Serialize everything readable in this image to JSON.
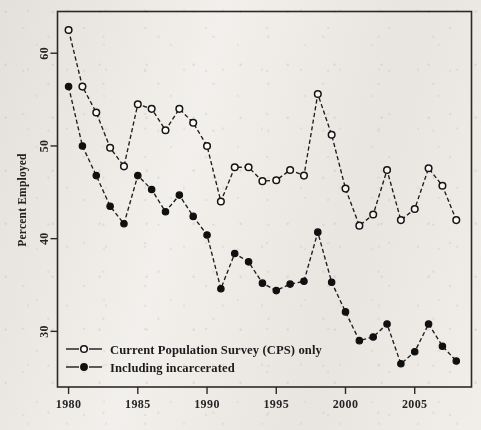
{
  "chart_data": {
    "type": "line",
    "title": "",
    "xlabel": "",
    "ylabel": "Percent Employed",
    "xlim": [
      1979.2,
      2009.1
    ],
    "ylim": [
      24.0,
      64.5
    ],
    "xticks": [
      1980,
      1985,
      1990,
      1995,
      2000,
      2005
    ],
    "yticks": [
      30,
      40,
      50,
      60
    ],
    "grid": false,
    "legend_position": "bottom-left",
    "x": [
      1980,
      1981,
      1982,
      1983,
      1984,
      1985,
      1986,
      1987,
      1988,
      1989,
      1990,
      1991,
      1992,
      1993,
      1994,
      1995,
      1996,
      1997,
      1998,
      1999,
      2000,
      2001,
      2002,
      2003,
      2004,
      2005,
      2006,
      2007,
      2008
    ],
    "series": [
      {
        "name": "Current Population Survey (CPS) only",
        "marker": "open-circle",
        "linestyle": "dashed",
        "values": [
          62.5,
          56.4,
          53.6,
          49.8,
          47.8,
          54.5,
          54.0,
          51.7,
          54.0,
          52.5,
          50.0,
          44.0,
          47.7,
          47.7,
          46.2,
          46.3,
          47.4,
          46.8,
          55.6,
          51.2,
          45.4,
          41.4,
          42.6,
          47.4,
          42.0,
          43.2,
          47.6,
          45.7,
          42.0
        ]
      },
      {
        "name": "Including incarcerated",
        "marker": "filled-circle",
        "linestyle": "dashed",
        "values": [
          56.4,
          50.0,
          46.8,
          43.5,
          41.6,
          46.8,
          45.3,
          42.9,
          44.7,
          42.4,
          40.4,
          34.6,
          38.4,
          37.5,
          35.2,
          34.4,
          35.1,
          35.4,
          40.7,
          35.3,
          32.1,
          29.0,
          29.4,
          30.8,
          26.5,
          27.8,
          30.8,
          28.4,
          26.8
        ]
      }
    ]
  },
  "legend": {
    "items": [
      {
        "label": "Current Population Survey (CPS) only",
        "marker": "open-circle"
      },
      {
        "label": "Including incarcerated",
        "marker": "filled-circle"
      }
    ]
  },
  "axis": {
    "y_title": "Percent Employed",
    "x_tick_labels": [
      "1980",
      "1985",
      "1990",
      "1995",
      "2000",
      "2005"
    ],
    "y_tick_labels": [
      "30",
      "40",
      "50",
      "60"
    ]
  },
  "colors": {
    "ink": "#151515",
    "paper": "#f4f2ef",
    "marker_fill_open": "#ffffff",
    "marker_fill_solid": "#101010"
  }
}
